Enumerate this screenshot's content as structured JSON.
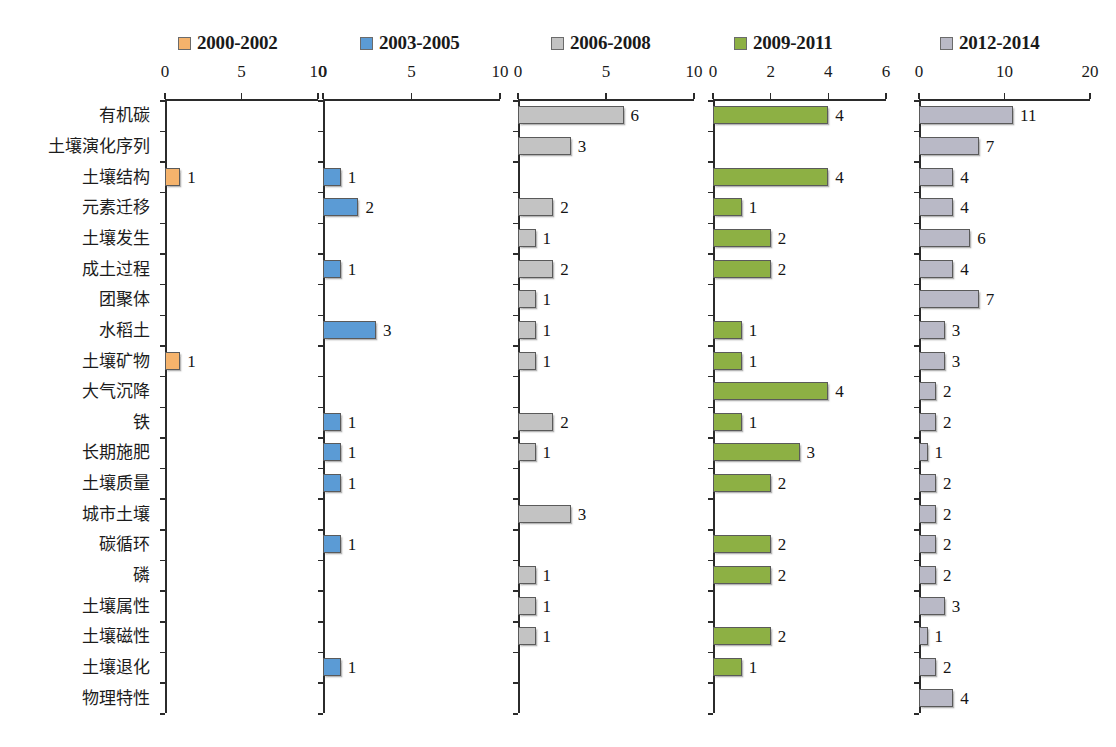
{
  "chart_data": {
    "type": "bar",
    "orientation": "horizontal",
    "title": "",
    "subtitle": "",
    "xlabel": "",
    "ylabel": "",
    "grid": false,
    "legend_position": "top",
    "categories": [
      "有机碳",
      "土壤演化序列",
      "土壤结构",
      "元素迁移",
      "土壤发生",
      "成土过程",
      "团聚体",
      "水稻土",
      "土壤矿物",
      "大气沉降",
      "铁",
      "长期施肥",
      "土壤质量",
      "城市土壤",
      "碳循环",
      "磷",
      "土壤属性",
      "土壤磁性",
      "土壤退化",
      "物理特性"
    ],
    "panels": [
      {
        "name": "2000-2002",
        "color": "#f5b36c",
        "xlim": [
          0,
          10
        ],
        "xticks": [
          0,
          5,
          10
        ],
        "xticklabels": [
          "0",
          "5",
          "10"
        ],
        "values": [
          0,
          0,
          1,
          0,
          0,
          0,
          0,
          0,
          1,
          0,
          0,
          0,
          0,
          0,
          0,
          0,
          0,
          0,
          0,
          0
        ]
      },
      {
        "name": "2003-2005",
        "color": "#5b9bd5",
        "xlim": [
          0,
          10
        ],
        "xticks": [
          0,
          5,
          10
        ],
        "xticklabels": [
          "0",
          "5",
          "10"
        ],
        "values": [
          0,
          0,
          1,
          2,
          0,
          1,
          0,
          3,
          0,
          0,
          1,
          1,
          1,
          0,
          1,
          0,
          0,
          0,
          1,
          0
        ]
      },
      {
        "name": "2006-2008",
        "color": "#c3c3c3",
        "xlim": [
          0,
          10
        ],
        "xticks": [
          0,
          5,
          10
        ],
        "xticklabels": [
          "0",
          "5",
          "10"
        ],
        "values": [
          6,
          3,
          0,
          2,
          1,
          2,
          1,
          1,
          1,
          0,
          2,
          1,
          0,
          3,
          0,
          1,
          1,
          1,
          0,
          0
        ]
      },
      {
        "name": "2009-2011",
        "color": "#8db044",
        "xlim": [
          0,
          6
        ],
        "xticks": [
          0,
          2,
          4,
          6
        ],
        "xticklabels": [
          "0",
          "2",
          "4",
          "6"
        ],
        "values": [
          4,
          0,
          4,
          1,
          2,
          2,
          0,
          1,
          1,
          4,
          1,
          3,
          2,
          0,
          2,
          2,
          0,
          2,
          1,
          0
        ]
      },
      {
        "name": "2012-2014",
        "color": "#b9b9c6",
        "xlim": [
          0,
          20
        ],
        "xticks": [
          0,
          10,
          20
        ],
        "xticklabels": [
          "0",
          "10",
          "20"
        ],
        "values": [
          11,
          7,
          4,
          4,
          6,
          4,
          7,
          3,
          3,
          2,
          2,
          1,
          2,
          2,
          2,
          2,
          3,
          1,
          2,
          4
        ]
      }
    ]
  }
}
